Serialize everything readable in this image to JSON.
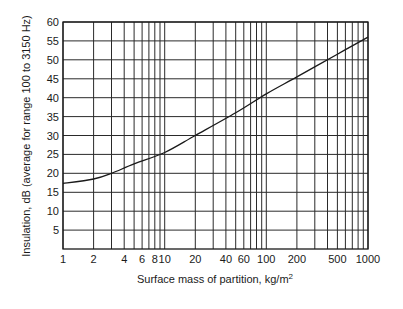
{
  "chart_data": {
    "type": "line",
    "title": "",
    "xlabel": "Surface mass of partition, kg/m",
    "xlabel_superscript": "2",
    "ylabel": "Insulation, dB (average for range 100 to 3150 Hz)",
    "xscale": "log",
    "xlim": [
      1,
      1000
    ],
    "ylim": [
      0,
      60
    ],
    "grid": true,
    "legend": null,
    "x_tick_labels": [
      "1",
      "2",
      "4",
      "6",
      "8",
      "10",
      "20",
      "40",
      "60",
      "100",
      "200",
      "500",
      "1000"
    ],
    "x_tick_values": [
      1,
      2,
      4,
      6,
      8,
      10,
      20,
      40,
      60,
      100,
      200,
      500,
      1000
    ],
    "x_gridlines": [
      1,
      2,
      3,
      4,
      5,
      6,
      7,
      8,
      9,
      10,
      20,
      30,
      40,
      50,
      60,
      70,
      80,
      90,
      100,
      200,
      300,
      400,
      500,
      600,
      700,
      800,
      900,
      1000
    ],
    "y_tick_labels": [
      "5",
      "10",
      "15",
      "20",
      "25",
      "30",
      "35",
      "40",
      "45",
      "50",
      "55",
      "60"
    ],
    "y_tick_values": [
      5,
      10,
      15,
      20,
      25,
      30,
      35,
      40,
      45,
      50,
      55,
      60
    ],
    "series": [
      {
        "name": "Mass law insulation",
        "x": [
          1,
          2,
          3,
          5,
          10,
          20,
          50,
          100,
          200,
          500,
          1000
        ],
        "y": [
          17.3,
          18.5,
          20,
          22.5,
          25.5,
          30,
          36,
          41,
          45.5,
          51.5,
          56
        ]
      }
    ]
  }
}
